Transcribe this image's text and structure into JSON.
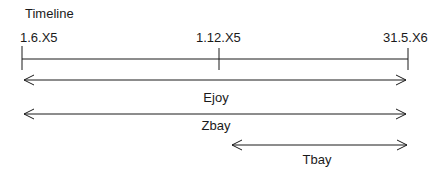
{
  "diagram": {
    "title": "Timeline",
    "ticks": [
      {
        "label": "1.6.X5",
        "x": 22
      },
      {
        "label": "1.12.X5",
        "x": 219
      },
      {
        "label": "31.5.X6",
        "x": 408
      }
    ],
    "spans": [
      {
        "label": "Ejoy",
        "from": "1.6.X5",
        "to": "31.5.X6"
      },
      {
        "label": "Zbay",
        "from": "1.6.X5",
        "to": "31.5.X6"
      },
      {
        "label": "Tbay",
        "from": "1.12.X5",
        "to": "31.5.X6"
      }
    ],
    "colors": {
      "line": "#1a1a1a",
      "background": "#ffffff"
    }
  }
}
